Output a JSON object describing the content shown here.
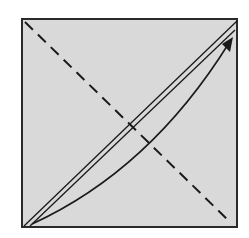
{
  "diagram": {
    "colors": {
      "paper": "#d9d9d9",
      "border": "#2a2a2a",
      "line": "#1a1a1a",
      "background": "#ffffff"
    },
    "paper_square": {
      "x": 22,
      "y": 19,
      "width": 215,
      "height": 208
    },
    "valley_fold_line": {
      "style": "dashed",
      "from": [
        24,
        21
      ],
      "to": [
        230,
        222
      ]
    },
    "existing_crease": {
      "style": "double-line",
      "from": [
        24,
        226
      ],
      "to": [
        236,
        22
      ]
    },
    "fold_arrow": {
      "from": [
        30,
        224
      ],
      "to": [
        232,
        40
      ],
      "direction": "bottom-left to top-right"
    }
  }
}
